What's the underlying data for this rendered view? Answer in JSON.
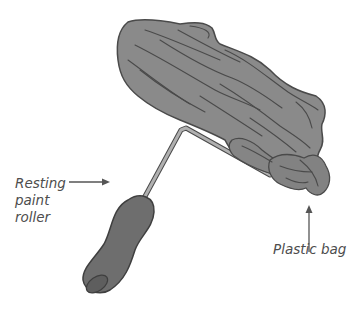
{
  "figure": {
    "labels": {
      "roller": "Resting\npaint\nroller",
      "bag": "Plastic bag"
    },
    "colors": {
      "bag_fill": "#8a8a8a",
      "outline": "#4a4a4a",
      "handle_fill": "#6e6e6e",
      "frame": "#9a9a9a",
      "label_text": "#4d4d4d",
      "arrow": "#555555"
    }
  }
}
